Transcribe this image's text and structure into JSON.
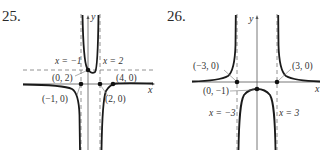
{
  "figures": [
    {
      "number": "25.",
      "axes": {
        "x_label": "x",
        "y_label": "y"
      },
      "asymptotes": {
        "vertical": [
          "x = −1",
          "x = 2"
        ],
        "horizontal": "dashed"
      },
      "points": [
        {
          "label": "(0, 2)"
        },
        {
          "label": "(4, 0)"
        },
        {
          "label": "(−1, 0)"
        },
        {
          "label": "(2, 0)"
        }
      ]
    },
    {
      "number": "26.",
      "axes": {
        "x_label": "x",
        "y_label": "y"
      },
      "asymptotes": {
        "vertical": [
          "x = −3",
          "x = 3"
        ]
      },
      "points": [
        {
          "label": "(−3, 0)"
        },
        {
          "label": "(3, 0)"
        },
        {
          "label": "(0, −1)"
        }
      ]
    }
  ],
  "colors": {
    "curve": "#1a1a1a",
    "axis": "#555555",
    "dashed": "#777777",
    "text": "#333333"
  }
}
